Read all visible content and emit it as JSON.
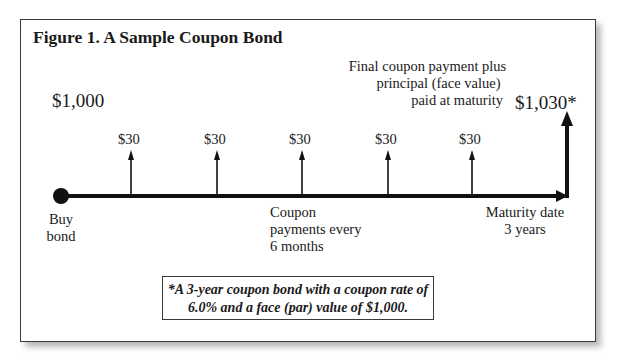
{
  "figure": {
    "title": "Figure 1. A Sample Coupon Bond",
    "purchase_price": "$1,000",
    "final_payment": "$1,030*",
    "final_payment_caption": [
      "Final coupon payment plus",
      "principal (face value)",
      "paid at maturity"
    ],
    "coupon_payments": [
      "$30",
      "$30",
      "$30",
      "$30",
      "$30"
    ],
    "start_label": [
      "Buy",
      "bond"
    ],
    "coupon_label": [
      "Coupon",
      "payments every",
      "6 months"
    ],
    "maturity_label": [
      "Maturity date",
      "3 years"
    ],
    "note": [
      "*A 3-year coupon bond with a coupon rate of",
      "6.0% and a face (par) value of $1,000."
    ]
  },
  "colors": {
    "line": "#111111",
    "border": "#3a3a3a"
  }
}
